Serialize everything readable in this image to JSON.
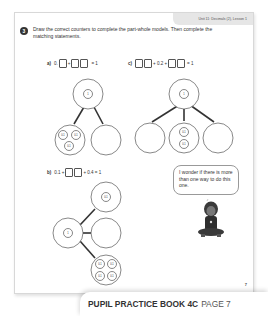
{
  "header": {
    "unit_label": "Unit 11: Decimals (2), Lesson 1"
  },
  "question": {
    "number": "3",
    "instruction": "Draw the correct counters to complete the part-whole models. Then complete the matching statements."
  },
  "parts": {
    "a": {
      "label": "a)",
      "prefix": "0.",
      "plus": "+",
      "equals": "= 1",
      "whole": "1",
      "counters": [
        "0.1",
        "0.1",
        "0.1"
      ]
    },
    "b": {
      "label": "b)",
      "prefix": "0.1 +",
      "suffix": "+ 0.4 = 1",
      "whole": "1",
      "top_part": "0.1",
      "counters": [
        "0.1",
        "0.1",
        "0.1",
        "0.1"
      ]
    },
    "c": {
      "label": "c)",
      "middle": "+ 0.2 +",
      "equals": "= 1",
      "whole": "1",
      "counters": [
        "0.1",
        "0.1"
      ]
    }
  },
  "speech_bubble": {
    "text": "I wonder if there is more than one way to do this one."
  },
  "page_number": "7",
  "footer": {
    "book": "PUPIL PRACTICE BOOK 4C",
    "page": "PAGE 7"
  }
}
